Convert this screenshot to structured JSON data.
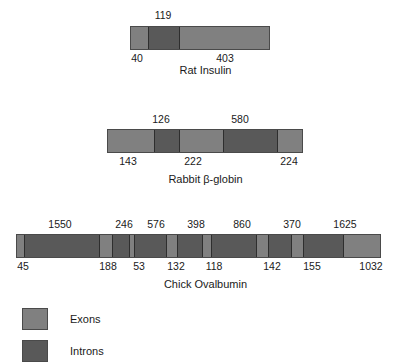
{
  "figure": {
    "colors": {
      "exon": "#808080",
      "intron": "#595959",
      "outline": "#4a4a4a",
      "divider": "#2e2e2e",
      "background": "#ffffff",
      "text": "#1a1a1a"
    }
  },
  "genes": [
    {
      "caption": "Rat Insulin",
      "bar": {
        "left": 130,
        "width": 140,
        "top": 26
      },
      "caption_top": 64,
      "labels_top_y": 8,
      "labels_bottom_y": 51,
      "segments": [
        {
          "type": "exon",
          "label": "40",
          "width": 19
        },
        {
          "type": "intron",
          "label": "119",
          "width": 31
        },
        {
          "type": "exon",
          "label": "403",
          "width": 90
        }
      ],
      "labels_top": [
        {
          "text": "119",
          "x": 163
        }
      ],
      "labels_bottom": [
        {
          "text": "40",
          "x": 137
        },
        {
          "text": "403",
          "x": 225
        }
      ]
    },
    {
      "caption": "Rabbit  β-globin",
      "bar": {
        "left": 107,
        "width": 196,
        "top": 129
      },
      "caption_top": 173,
      "labels_top_y": 112,
      "labels_bottom_y": 154,
      "segments": [
        {
          "type": "exon",
          "label": "143",
          "width": 48
        },
        {
          "type": "intron",
          "label": "126",
          "width": 25
        },
        {
          "type": "exon",
          "label": "222",
          "width": 44
        },
        {
          "type": "intron",
          "label": "580",
          "width": 54
        },
        {
          "type": "exon",
          "label": "224",
          "width": 25
        }
      ],
      "labels_top": [
        {
          "text": "126",
          "x": 161
        },
        {
          "text": "580",
          "x": 240
        }
      ],
      "labels_bottom": [
        {
          "text": "143",
          "x": 128
        },
        {
          "text": "222",
          "x": 193
        },
        {
          "text": "224",
          "x": 289
        }
      ]
    },
    {
      "caption": "Chick Ovalbumin",
      "bar": {
        "left": 16,
        "width": 365,
        "top": 234
      },
      "caption_top": 278,
      "labels_top_y": 217,
      "labels_bottom_y": 259,
      "segments": [
        {
          "type": "exon",
          "label": "45",
          "width": 9
        },
        {
          "type": "intron",
          "label": "1550",
          "width": 75
        },
        {
          "type": "exon",
          "label": "188",
          "width": 13
        },
        {
          "type": "intron",
          "label": "246",
          "width": 17
        },
        {
          "type": "exon",
          "label": "53",
          "width": 5
        },
        {
          "type": "intron",
          "label": "576",
          "width": 32
        },
        {
          "type": "exon",
          "label": "132",
          "width": 11
        },
        {
          "type": "intron",
          "label": "398",
          "width": 25
        },
        {
          "type": "exon",
          "label": "118",
          "width": 9
        },
        {
          "type": "intron",
          "label": "860",
          "width": 45
        },
        {
          "type": "exon",
          "label": "142",
          "width": 12
        },
        {
          "type": "intron",
          "label": "370",
          "width": 23
        },
        {
          "type": "exon",
          "label": "155",
          "width": 12
        },
        {
          "type": "intron",
          "label": "1625",
          "width": 40
        },
        {
          "type": "exon",
          "label": "1032",
          "width": 37
        }
      ],
      "labels_top": [
        {
          "text": "1550",
          "x": 60
        },
        {
          "text": "246",
          "x": 124
        },
        {
          "text": "576",
          "x": 156
        },
        {
          "text": "398",
          "x": 196
        },
        {
          "text": "860",
          "x": 242
        },
        {
          "text": "370",
          "x": 292
        },
        {
          "text": "1625",
          "x": 345
        }
      ],
      "labels_bottom": [
        {
          "text": "45",
          "x": 23
        },
        {
          "text": "188",
          "x": 108
        },
        {
          "text": "53",
          "x": 139
        },
        {
          "text": "132",
          "x": 176
        },
        {
          "text": "118",
          "x": 214
        },
        {
          "text": "142",
          "x": 272
        },
        {
          "text": "155",
          "x": 312
        },
        {
          "text": "1032",
          "x": 371
        }
      ]
    }
  ],
  "legend": {
    "top": 308,
    "items": [
      {
        "label": "Exons",
        "type": "exon",
        "y": 0
      },
      {
        "label": "Introns",
        "type": "intron",
        "y": 32
      }
    ]
  }
}
